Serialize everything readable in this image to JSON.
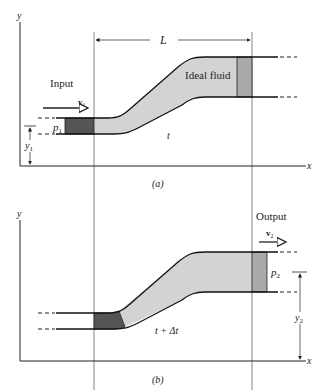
{
  "figure": {
    "colors": {
      "background": "#ffffff",
      "line": "#1a1a1a",
      "guide_line": "#555555",
      "fluid": "#d3d3d3",
      "input_element": "#555555",
      "output_element": "#a9a9a9"
    }
  },
  "panel_a": {
    "caption": "(a)",
    "axis_y_label": "y",
    "axis_x_label": "x",
    "length_label": "L",
    "input_label": "Input",
    "velocity_label": "v",
    "velocity_subscript": "1",
    "pressure_label": "p",
    "pressure_subscript": "1",
    "height_label": "y",
    "height_subscript": "1",
    "fluid_label": "Ideal fluid",
    "time_label": "t"
  },
  "panel_b": {
    "caption": "(b)",
    "axis_y_label": "y",
    "axis_x_label": "x",
    "output_label": "Output",
    "velocity_label": "v",
    "velocity_subscript": "2",
    "pressure_label": "p",
    "pressure_subscript": "2",
    "height_label": "y",
    "height_subscript": "2",
    "time_label": "t + Δt"
  }
}
